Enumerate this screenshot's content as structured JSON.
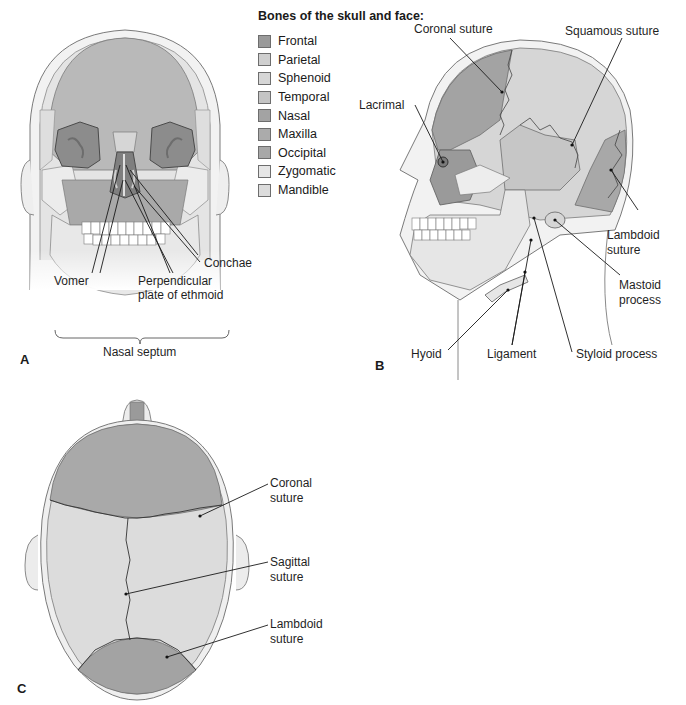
{
  "legend": {
    "title": "Bones of the skull and face:",
    "items": [
      {
        "label": "Frontal",
        "color": "#9a9a9a"
      },
      {
        "label": "Parietal",
        "color": "#cfcfcf"
      },
      {
        "label": "Sphenoid",
        "color": "#d6d6d6"
      },
      {
        "label": "Temporal",
        "color": "#c4c4c4"
      },
      {
        "label": "Nasal",
        "color": "#a3a3a3"
      },
      {
        "label": "Maxilla",
        "color": "#ababab"
      },
      {
        "label": "Occipital",
        "color": "#a8a8a8"
      },
      {
        "label": "Zygomatic",
        "color": "#e6e6e6"
      },
      {
        "label": "Mandible",
        "color": "#dcdcdc"
      }
    ]
  },
  "panel_a": {
    "letter": "A",
    "labels": {
      "conchae": "Conchae",
      "vomer": "Vomer",
      "perpendicular_line1": "Perpendicular",
      "perpendicular_line2": "plate of ethmoid",
      "nasal_septum": "Nasal septum"
    }
  },
  "panel_b": {
    "letter": "B",
    "labels": {
      "coronal_suture": "Coronal suture",
      "squamous_suture": "Squamous suture",
      "lacrimal": "Lacrimal",
      "lambdoid_line1": "Lambdoid",
      "lambdoid_line2": "suture",
      "mastoid_line1": "Mastoid",
      "mastoid_line2": "process",
      "hyoid": "Hyoid",
      "ligament": "Ligament",
      "styloid_process": "Styloid process"
    }
  },
  "panel_c": {
    "letter": "C",
    "labels": {
      "coronal_line1": "Coronal",
      "coronal_line2": "suture",
      "sagittal_line1": "Sagittal",
      "sagittal_line2": "suture",
      "lambdoid_line1": "Lambdoid",
      "lambdoid_line2": "suture"
    }
  }
}
